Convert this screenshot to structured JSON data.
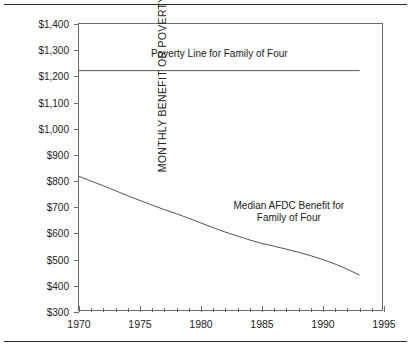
{
  "chart_data": {
    "type": "line",
    "title": "",
    "xlabel": "",
    "ylabel": "MONTHLY BENEFIT OR POVERTY LINE",
    "xlim": [
      1970,
      1995
    ],
    "ylim": [
      300,
      1400
    ],
    "grid": false,
    "legend_position": "inline-annotation",
    "y_tick_labels": [
      "$1,400",
      "$1,300",
      "$1,200",
      "$1,100",
      "$1,000",
      "$900",
      "$800",
      "$700",
      "$600",
      "$500",
      "$400",
      "$300"
    ],
    "y_tick_values": [
      1400,
      1300,
      1200,
      1100,
      1000,
      900,
      800,
      700,
      600,
      500,
      400,
      300
    ],
    "x_tick_labels": [
      "1970",
      "1975",
      "1980",
      "1985",
      "1990",
      "1995"
    ],
    "x_tick_values": [
      1970,
      1975,
      1980,
      1985,
      1990,
      1995
    ],
    "x_minor_tick_step": 1,
    "series": [
      {
        "name": "Poverty Line for Family of Four",
        "annotation": "Poverty Line for Family of Four",
        "color": "#555555",
        "x": [
          1970,
          1975,
          1980,
          1985,
          1990,
          1993
        ],
        "values": [
          1222,
          1222,
          1222,
          1222,
          1222,
          1222
        ]
      },
      {
        "name": "Median AFDC Benefit for Family of Four",
        "annotation_line1": "Median AFDC Benefit for",
        "annotation_line2": "Family of Four",
        "color": "#555555",
        "x": [
          1970,
          1971,
          1972,
          1973,
          1974,
          1975,
          1976,
          1977,
          1978,
          1979,
          1980,
          1981,
          1982,
          1983,
          1984,
          1985,
          1986,
          1987,
          1988,
          1989,
          1990,
          1991,
          1992,
          1993
        ],
        "values": [
          818,
          800,
          782,
          763,
          744,
          726,
          708,
          691,
          675,
          658,
          640,
          622,
          605,
          590,
          575,
          562,
          551,
          540,
          528,
          515,
          500,
          483,
          463,
          441
        ]
      }
    ]
  },
  "annotations": {
    "poverty_label": "Poverty Line for Family of Four",
    "afdc_label_line1": "Median AFDC Benefit for",
    "afdc_label_line2": "Family of Four"
  },
  "colors": {
    "line": "#555555",
    "axis": "#6b6b6b",
    "rule": "#2b2b2b",
    "text": "#222222",
    "background": "#ffffff"
  }
}
